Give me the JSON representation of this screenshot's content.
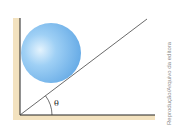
{
  "diagram": {
    "angle_label": "θ",
    "credit": "Reprodução/Arquivo da editora",
    "colors": {
      "surface": "#f3e2bf",
      "line": "#222222",
      "ball_light": "#d6ecfc",
      "ball_mid": "#8cc4f2",
      "ball_dark": "#5aa2e2"
    },
    "elements": {
      "wall": "vertical wall",
      "floor": "horizontal floor",
      "incline": "inclined plane",
      "ball": "sphere resting between wall and incline"
    }
  }
}
